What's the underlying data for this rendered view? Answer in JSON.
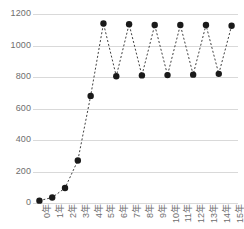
{
  "chart_data": {
    "type": "line",
    "title": "",
    "subtitle": "",
    "xlabel": "",
    "ylabel": "",
    "categories": [
      "0年",
      "1年",
      "2年",
      "3年",
      "4年",
      "5年",
      "6年",
      "7年",
      "8年",
      "9年",
      "10年",
      "11年",
      "12年",
      "13年",
      "14年",
      "15年"
    ],
    "x": [
      0,
      1,
      2,
      3,
      4,
      5,
      6,
      7,
      8,
      9,
      10,
      11,
      12,
      13,
      14,
      15
    ],
    "values": [
      15,
      35,
      95,
      270,
      680,
      1140,
      805,
      1135,
      810,
      1130,
      812,
      1130,
      815,
      1130,
      820,
      1125
    ],
    "ylim": [
      0,
      1200
    ],
    "yticks": [
      0,
      200,
      400,
      600,
      800,
      1000,
      1200
    ],
    "ytick_labels": [
      "0",
      "200",
      "400",
      "600",
      "800",
      "1000",
      "1200"
    ],
    "grid": true,
    "grid_axis": "y",
    "legend": false,
    "legend_position": "none",
    "marker": "circle",
    "line_style": "dashed",
    "series_color": "#1a1a1a",
    "grid_color": "#d9d9d9",
    "tick_label_color": "#6e6e6e",
    "background_color": "#ffffff"
  }
}
